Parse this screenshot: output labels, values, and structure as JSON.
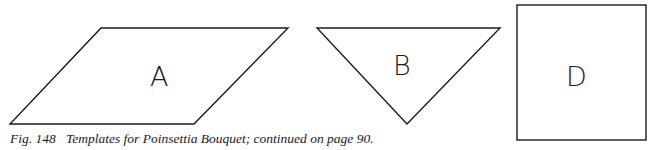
{
  "figure": {
    "caption": {
      "number": "Fig. 148",
      "text": "Templates for Poinsettia Bouquet; continued on page 90."
    },
    "templates": [
      {
        "label": "A",
        "shape": "parallelogram"
      },
      {
        "label": "B",
        "shape": "inverted-triangle"
      },
      {
        "label": "D",
        "shape": "square"
      }
    ]
  }
}
